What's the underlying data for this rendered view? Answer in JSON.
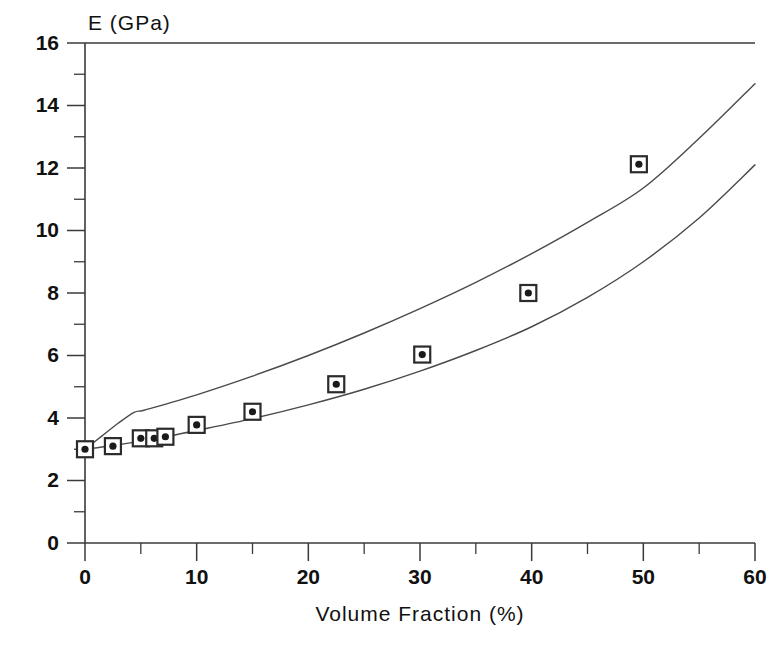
{
  "chart_data": {
    "type": "scatter",
    "title": "",
    "ylabel": "E (GPa)",
    "xlabel": "Volume Fraction (%)",
    "xlim": [
      0,
      60
    ],
    "ylim": [
      0,
      16
    ],
    "grid": false,
    "legend": "none",
    "x_major_ticks": [
      0,
      10,
      20,
      30,
      40,
      50,
      60
    ],
    "x_minor_ticks": [
      5,
      15,
      25,
      35,
      45,
      55
    ],
    "x_tick_labels": [
      "0",
      "10",
      "20",
      "30",
      "40",
      "50",
      "60"
    ],
    "y_major_ticks": [
      0,
      2,
      4,
      6,
      8,
      10,
      12,
      14,
      16
    ],
    "y_minor_ticks": [
      1,
      3,
      5,
      7,
      9,
      11,
      13,
      15
    ],
    "y_tick_labels": [
      "0",
      "2",
      "4",
      "6",
      "8",
      "10",
      "12",
      "14",
      "16"
    ],
    "series": [
      {
        "name": "Experimental data",
        "type": "scatter",
        "marker": "square-with-dot",
        "x": [
          0.0,
          2.5,
          5.0,
          6.2,
          7.2,
          10.0,
          15.0,
          22.5,
          30.2,
          39.7,
          49.6
        ],
        "y": [
          3.0,
          3.1,
          3.35,
          3.35,
          3.4,
          3.78,
          4.2,
          5.08,
          6.03,
          8.0,
          12.12
        ]
      },
      {
        "name": "Upper bound curve",
        "type": "line",
        "x": [
          0.0,
          1.5,
          3.0,
          4.4,
          5.2,
          7.0,
          10.0,
          15.0,
          20.0,
          25.0,
          30.0,
          35.0,
          40.0,
          45.0,
          50.0,
          55.0,
          60.0
        ],
        "y": [
          3.0,
          3.42,
          3.84,
          4.18,
          4.24,
          4.42,
          4.74,
          5.34,
          6.0,
          6.72,
          7.5,
          8.34,
          9.26,
          10.26,
          11.36,
          12.95,
          14.7
        ]
      },
      {
        "name": "Lower bound curve",
        "type": "line",
        "x": [
          0.0,
          2.5,
          5.0,
          7.5,
          10.0,
          15.0,
          20.0,
          25.0,
          30.0,
          35.0,
          40.0,
          45.0,
          50.0,
          55.0,
          60.0
        ],
        "y": [
          3.0,
          3.12,
          3.26,
          3.42,
          3.6,
          3.98,
          4.42,
          4.92,
          5.5,
          6.16,
          6.92,
          7.86,
          9.0,
          10.4,
          12.1
        ]
      }
    ]
  },
  "colors": {
    "curve": "#4a4a4a",
    "axis": "#3a3a3a",
    "marker_edge": "#2b2b2b",
    "marker_fill": "#ffffff",
    "marker_dot": "#1a1a1a",
    "background": "#ffffff"
  }
}
